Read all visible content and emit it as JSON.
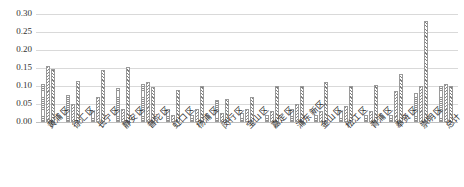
{
  "chart_data": {
    "type": "bar",
    "title": "",
    "subtitle": "",
    "xlabel": "",
    "ylabel": "",
    "ylim": [
      0.0,
      0.3
    ],
    "ytick_labels": [
      "0.00",
      "0.05",
      "0.10",
      "0.15",
      "0.20",
      "0.25",
      "0.30"
    ],
    "ytick_values": [
      0.0,
      0.05,
      0.1,
      0.15,
      0.2,
      0.25,
      0.3
    ],
    "grid": true,
    "grid_axis": "y",
    "legend": "none",
    "legend_position": "none",
    "annotations": [],
    "categories": [
      "黄浦区",
      "徐汇区",
      "长宁区",
      "静安区",
      "普陀区",
      "虹口区",
      "杨浦区",
      "闵行区",
      "宝山区",
      "嘉定区",
      "浦东新区",
      "金山区",
      "松江区",
      "青浦区",
      "奉贤区",
      "崇明区",
      "总计"
    ],
    "series": [
      {
        "name": "series-1",
        "values": [
          0.105,
          0.075,
          0.03,
          0.095,
          0.105,
          0.035,
          0.02,
          0.06,
          0.025,
          0.02,
          0.035,
          0.02,
          0.03,
          0.02,
          0.02,
          0.08,
          0.1
        ]
      },
      {
        "name": "series-2",
        "values": [
          0.155,
          0.05,
          0.07,
          0.035,
          0.11,
          0.02,
          0.035,
          0.025,
          0.035,
          0.03,
          0.05,
          0.03,
          0.045,
          0.03,
          0.085,
          0.1,
          0.105
        ]
      },
      {
        "name": "series-3",
        "values": [
          0.148,
          0.113,
          0.145,
          0.153,
          0.097,
          0.09,
          0.1,
          0.065,
          0.07,
          0.1,
          0.1,
          0.11,
          0.1,
          0.103,
          0.133,
          0.28,
          0.1
        ]
      }
    ]
  }
}
